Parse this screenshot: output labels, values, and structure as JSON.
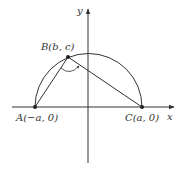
{
  "diagram": {
    "type": "geometry",
    "axes": {
      "x_label": "x",
      "y_label": "y"
    },
    "points": {
      "A": {
        "label": "A(−a, 0)"
      },
      "B": {
        "label": "B(b, c)"
      },
      "C": {
        "label": "C(a, 0)"
      }
    },
    "colors": {
      "line": "#333333",
      "background": "#ffffff"
    }
  }
}
